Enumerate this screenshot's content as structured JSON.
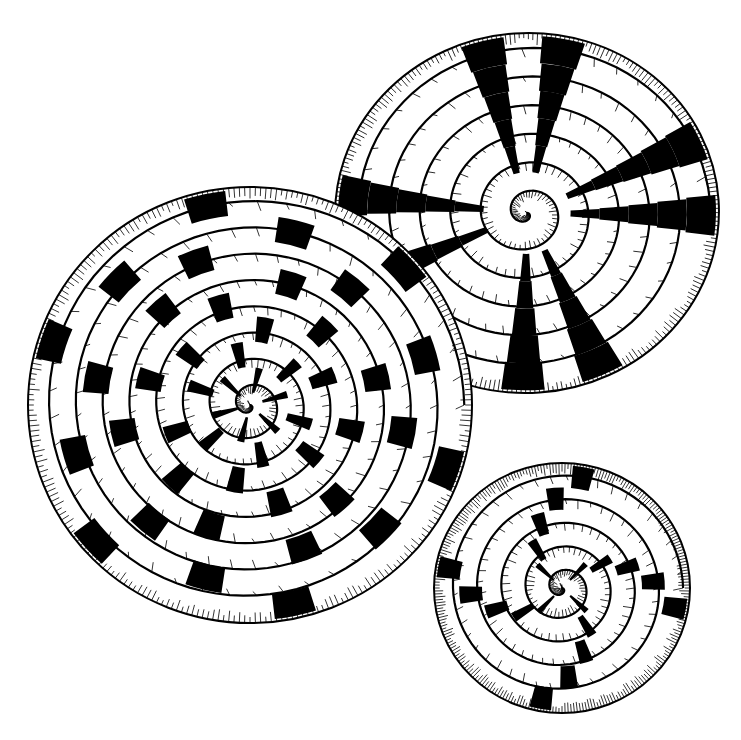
{
  "illustration": {
    "subject": "three coiled baskets, pen-and-ink drawing",
    "background": "#ffffff",
    "ink": "#000000",
    "width": 741,
    "height": 740
  },
  "baskets": [
    {
      "name": "basket-top-right",
      "cx": 527,
      "cy": 213,
      "rx": 192,
      "ry": 180,
      "rotation": -4,
      "coils": 6,
      "pattern": "radial-ladder",
      "spokes": [
        -100,
        -75,
        -20,
        5,
        70,
        95,
        160,
        190
      ],
      "drawOrder": 0
    },
    {
      "name": "basket-large-left",
      "cx": 250,
      "cy": 405,
      "rx": 222,
      "ry": 218,
      "rotation": 0,
      "coils": 8,
      "pattern": "stepped-checker",
      "spokes": [
        -110,
        -80,
        -50,
        -20,
        10,
        40,
        70,
        100,
        130,
        160,
        190,
        220
      ],
      "drawOrder": 1
    },
    {
      "name": "basket-small-bottom-right",
      "cx": 562,
      "cy": 588,
      "rx": 128,
      "ry": 125,
      "rotation": 0,
      "coils": 5,
      "pattern": "pinwheel",
      "spokes": [
        -60,
        30,
        120,
        210
      ],
      "drawOrder": 2
    }
  ]
}
